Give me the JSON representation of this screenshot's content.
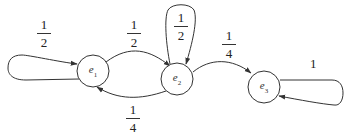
{
  "diagram": {
    "type": "markov-chain-state-diagram",
    "nodes": [
      {
        "id": "e1",
        "label": "e",
        "subscript": "1",
        "cx": 93,
        "cy": 71,
        "r": 16
      },
      {
        "id": "e2",
        "label": "e",
        "subscript": "2",
        "cx": 177,
        "cy": 79,
        "r": 16
      },
      {
        "id": "e3",
        "label": "e",
        "subscript": "3",
        "cx": 264,
        "cy": 87,
        "r": 16
      }
    ],
    "edges": [
      {
        "from": "e1",
        "to": "e1",
        "label": {
          "num": "1",
          "den": "2"
        }
      },
      {
        "from": "e1",
        "to": "e2",
        "label": {
          "num": "1",
          "den": "2"
        }
      },
      {
        "from": "e2",
        "to": "e1",
        "label": {
          "num": "1",
          "den": "4"
        }
      },
      {
        "from": "e2",
        "to": "e2",
        "label": {
          "num": "1",
          "den": "2"
        }
      },
      {
        "from": "e2",
        "to": "e3",
        "label": {
          "num": "1",
          "den": "4"
        }
      },
      {
        "from": "e3",
        "to": "e3",
        "label": {
          "value": "1"
        }
      }
    ],
    "colors": {
      "stroke": "#333333",
      "background": "#ffffff",
      "text": "#222222"
    }
  }
}
